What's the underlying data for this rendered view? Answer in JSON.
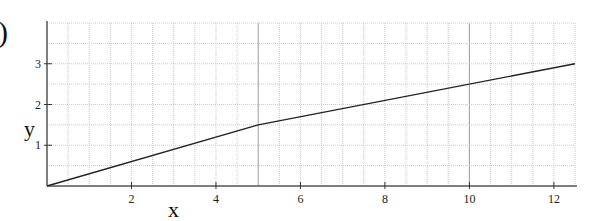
{
  "panel_label": ")",
  "chart_data": {
    "type": "line",
    "title": "",
    "xlabel": "x",
    "ylabel": "y",
    "xlim": [
      0,
      12.5
    ],
    "ylim": [
      0,
      4
    ],
    "x_ticks": [
      2,
      4,
      6,
      8,
      10,
      12
    ],
    "y_ticks": [
      1,
      2,
      3
    ],
    "x_tick_labels": [
      "2",
      "4",
      "6",
      "8",
      "10",
      "12"
    ],
    "y_tick_labels": [
      "1",
      "2",
      "3"
    ],
    "grid": true,
    "grid_minor_step_x": 0.5,
    "grid_minor_step_y": 0.5,
    "grid_major_x": [
      5,
      10
    ],
    "legend": null,
    "series": [
      {
        "name": "y(x)",
        "x": [
          0,
          5,
          12.5
        ],
        "y": [
          0,
          1.5,
          3.0
        ],
        "color": "#222222"
      }
    ]
  },
  "style": {
    "axis_color": "#555555",
    "grid_color": "#c8c8c8",
    "grid_major_color": "#9a9a9a",
    "line_color": "#222222"
  }
}
